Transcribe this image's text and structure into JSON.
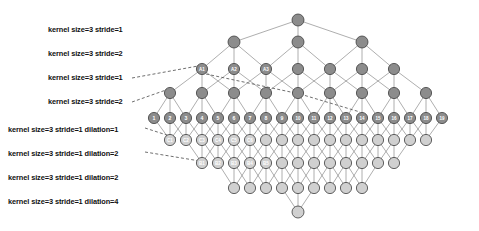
{
  "diagram": {
    "background": "#ffffff",
    "colors": {
      "node_dark": "#8c8c8c",
      "node_light": "#d0d0d0",
      "node_stroke": "#3d3d3d",
      "edge": "#6b6b6b",
      "dashed": "#4a4a4a",
      "label_text": "#111111",
      "node_text": "#ffffff"
    },
    "labels": [
      {
        "id": "layer-1",
        "text": "kernel size=3 stride=1",
        "x": 48,
        "y": 26
      },
      {
        "id": "layer-2",
        "text": "kernel size=3 stride=2",
        "x": 48,
        "y": 50
      },
      {
        "id": "layer-3",
        "text": "kernel size=3 stride=1",
        "x": 48,
        "y": 74
      },
      {
        "id": "layer-4",
        "text": "kernel size=3 stride=2",
        "x": 48,
        "y": 98
      },
      {
        "id": "layer-5",
        "text": "kernel size=3 stride=1 dilation=1",
        "x": 8,
        "y": 126
      },
      {
        "id": "layer-6",
        "text": "kernel size=3 stride=1 dilation=2",
        "x": 8,
        "y": 150
      },
      {
        "id": "layer-7",
        "text": "kernel size=3 stride=1 dilation=2",
        "x": 8,
        "y": 174
      },
      {
        "id": "layer-8",
        "text": "kernel size=3 stride=1 dilation=4",
        "x": 8,
        "y": 198
      }
    ],
    "rows": [
      {
        "id": "row-apex-top",
        "y": 20,
        "radius": 6.0,
        "fill": "node_dark",
        "count": 1,
        "x_start": 298.0,
        "x_step": 0,
        "node_labels": [
          ""
        ]
      },
      {
        "id": "row-2",
        "y": 42,
        "radius": 6.0,
        "fill": "node_dark",
        "count": 3,
        "x_start": 234.0,
        "x_step": 64.0,
        "node_labels": [
          "",
          "",
          ""
        ]
      },
      {
        "id": "row-3",
        "y": 69,
        "radius": 5.6,
        "fill": "node_dark",
        "count": 7,
        "x_start": 202.0,
        "x_step": 32.0,
        "node_labels": [
          "A1",
          "A2",
          "A3",
          "",
          "",
          "",
          ""
        ]
      },
      {
        "id": "row-4",
        "y": 93,
        "radius": 5.6,
        "fill": "node_dark",
        "count": 9,
        "x_start": 170.0,
        "x_step": 32.0,
        "node_labels": [
          "",
          "",
          "",
          "",
          "",
          "",
          "",
          "",
          ""
        ]
      },
      {
        "id": "row-5-numbered",
        "y": 118,
        "radius": 5.6,
        "fill": "node_dark",
        "count": 19,
        "x_start": 154.0,
        "x_step": 16.0,
        "node_labels": [
          "1",
          "2",
          "3",
          "4",
          "5",
          "6",
          "7",
          "8",
          "9",
          "10",
          "11",
          "12",
          "13",
          "14",
          "15",
          "16",
          "17",
          "18",
          "19"
        ]
      },
      {
        "id": "row-6-c",
        "y": 140,
        "radius": 5.6,
        "fill": "node_light",
        "count": 17,
        "x_start": 170.0,
        "x_step": 16.0,
        "node_labels": [
          "C1",
          "C2",
          "C3",
          "C4",
          "C5",
          "C6",
          "",
          "",
          "",
          "",
          "",
          "",
          "",
          "",
          "",
          "",
          ""
        ]
      },
      {
        "id": "row-7-b",
        "y": 163,
        "radius": 5.6,
        "fill": "node_light",
        "count": 13,
        "x_start": 202.0,
        "x_step": 16.0,
        "node_labels": [
          "B1",
          "B2",
          "B3",
          "B4",
          "B5",
          "",
          "",
          "",
          "",
          "",
          "",
          "",
          ""
        ]
      },
      {
        "id": "row-8",
        "y": 188,
        "radius": 5.6,
        "fill": "node_light",
        "count": 9,
        "x_start": 234.0,
        "x_step": 16.0,
        "node_labels": [
          "",
          "",
          "",
          "",
          "",
          "",
          "",
          "",
          ""
        ]
      },
      {
        "id": "row-apex-bottom",
        "y": 212,
        "radius": 6.0,
        "fill": "node_light",
        "count": 1,
        "x_start": 298.0,
        "x_step": 0,
        "node_labels": [
          ""
        ]
      }
    ],
    "connections": [
      {
        "from": "row-2",
        "to": "row-apex-top",
        "kernel": 3,
        "mode": "converge"
      },
      {
        "from": "row-3",
        "to": "row-2",
        "kernel": 3,
        "mode": "converge"
      },
      {
        "from": "row-4",
        "to": "row-3",
        "kernel": 3,
        "mode": "converge"
      },
      {
        "from": "row-5-numbered",
        "to": "row-4",
        "kernel": 3,
        "mode": "converge"
      },
      {
        "from": "row-5-numbered",
        "to": "row-6-c",
        "kernel": 3,
        "mode": "diverge"
      },
      {
        "from": "row-6-c",
        "to": "row-7-b",
        "kernel": 3,
        "mode": "diverge"
      },
      {
        "from": "row-7-b",
        "to": "row-8",
        "kernel": 3,
        "mode": "diverge"
      },
      {
        "from": "row-8",
        "to": "row-apex-bottom",
        "kernel": 3,
        "mode": "diverge"
      }
    ],
    "guides": [
      {
        "id": "guide-layer-3",
        "x1": 132,
        "y1": 78,
        "x2": 198,
        "y2": 66
      },
      {
        "id": "guide-layer-4",
        "x1": 132,
        "y1": 102,
        "x2": 166,
        "y2": 90
      },
      {
        "id": "guide-layer-5",
        "x1": 145,
        "y1": 128,
        "x2": 176,
        "y2": 138
      },
      {
        "id": "guide-layer-6",
        "x1": 145,
        "y1": 152,
        "x2": 200,
        "y2": 161
      },
      {
        "id": "guide-diag-a",
        "x1": 206,
        "y1": 74,
        "x2": 300,
        "y2": 94
      },
      {
        "id": "guide-diag-b",
        "x1": 300,
        "y1": 94,
        "x2": 360,
        "y2": 112
      }
    ]
  }
}
